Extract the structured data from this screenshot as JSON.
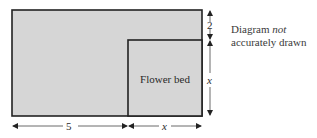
{
  "diagram": {
    "type": "geometry-figure",
    "regions": {
      "outer_rectangle": {
        "fill": "#d6d6d6",
        "stroke": "#222222"
      },
      "flower_bed": {
        "label": "Flower bed",
        "fill": "#d6d6d6",
        "stroke": "#222222"
      }
    },
    "dimensions": {
      "top_right_segment": {
        "label": "2",
        "orientation": "vertical"
      },
      "right_segment": {
        "label": "x",
        "orientation": "vertical"
      },
      "bottom_left_segment": {
        "label": "5",
        "orientation": "horizontal"
      },
      "bottom_right_segment": {
        "label": "x",
        "orientation": "horizontal"
      }
    },
    "note": {
      "prefix": "Diagram ",
      "emphasis": "not",
      "suffix": "accurately drawn"
    }
  }
}
